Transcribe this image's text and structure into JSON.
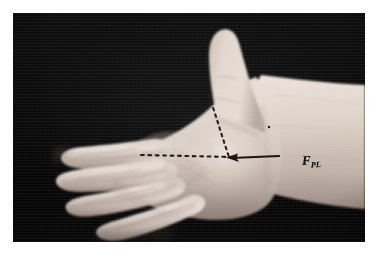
{
  "figure": {
    "kind": "clinical-photograph",
    "background_color": "#0a0a0a",
    "page_background": "#ffffff",
    "photo": {
      "x": 13,
      "y": 13,
      "width": 352,
      "height": 229
    }
  },
  "annotations": {
    "label": {
      "name": "fpl-label",
      "main": "F",
      "subscript": "PL",
      "full_text": "FPL",
      "color": "#15120f",
      "x": 289,
      "y": 141
    },
    "markings": [
      {
        "name": "diagonal-dashed-line",
        "style": "dashed",
        "color": "#1b1714",
        "description": "dashed line from thumb web / first webspace down to mid-palm junction",
        "from": {
          "x": 208,
          "y": 94
        },
        "to": {
          "x": 229,
          "y": 156
        }
      },
      {
        "name": "horizontal-dashed-line",
        "style": "dashed",
        "color": "#1b1714",
        "description": "dashed line across the palm from index finger base to the junction point",
        "from": {
          "x": 140,
          "y": 155
        },
        "to": {
          "x": 226,
          "y": 156
        }
      },
      {
        "name": "solid-arrow-line",
        "style": "solid-with-arrowhead",
        "color": "#14110e",
        "description": "solid line running from the wrist toward the palm, arrowhead pointing left at the junction",
        "from": {
          "x": 277,
          "y": 155
        },
        "to": {
          "x": 227,
          "y": 157
        },
        "arrowhead_at": "to"
      },
      {
        "name": "ink-dot-marker",
        "style": "dot",
        "color": "#1b1714",
        "description": "small ink dot on the distal forearm",
        "at": {
          "x": 268,
          "y": 126
        }
      }
    ]
  },
  "skin": {
    "highlight": "#efe6df",
    "midtone": "#d8cbc2",
    "shadow": "#9f9088",
    "deep_shadow": "#6f6158"
  }
}
